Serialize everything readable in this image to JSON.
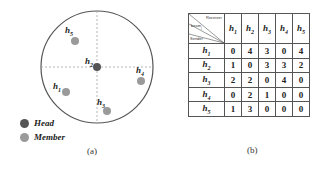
{
  "panel_a": {
    "caption": "(a)",
    "legend": [
      {
        "label": "Head",
        "color": "#555555"
      },
      {
        "label": "Member",
        "color": "#9a9a9a"
      }
    ],
    "nodes": [
      {
        "id": "h1",
        "base": "h",
        "sub": "1",
        "role": "Member"
      },
      {
        "id": "h2",
        "base": "h",
        "sub": "2",
        "role": "Head"
      },
      {
        "id": "h3",
        "base": "h",
        "sub": "3",
        "role": "Member"
      },
      {
        "id": "h4",
        "base": "h",
        "sub": "4",
        "role": "Member"
      },
      {
        "id": "h5",
        "base": "h",
        "sub": "5",
        "role": "Member"
      }
    ]
  },
  "panel_b": {
    "caption": "(b)",
    "corner": {
      "top": "Receiver",
      "middle": "beam",
      "middle_sub": "j",
      "bottom": "Sender"
    },
    "columns": [
      {
        "base": "h",
        "sub": "1"
      },
      {
        "base": "h",
        "sub": "2"
      },
      {
        "base": "h",
        "sub": "3"
      },
      {
        "base": "h",
        "sub": "4"
      },
      {
        "base": "h",
        "sub": "5"
      }
    ],
    "rows": [
      {
        "base": "h",
        "sub": "1",
        "values": [
          "0",
          "4",
          "3",
          "0",
          "4"
        ]
      },
      {
        "base": "h",
        "sub": "2",
        "values": [
          "1",
          "0",
          "3",
          "3",
          "2"
        ]
      },
      {
        "base": "h",
        "sub": "3",
        "values": [
          "2",
          "2",
          "0",
          "4",
          "0"
        ]
      },
      {
        "base": "h",
        "sub": "4",
        "values": [
          "0",
          "2",
          "1",
          "0",
          "0"
        ]
      },
      {
        "base": "h",
        "sub": "5",
        "values": [
          "1",
          "3",
          "0",
          "0",
          "0"
        ]
      }
    ]
  }
}
